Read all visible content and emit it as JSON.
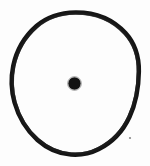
{
  "figure": {
    "title": "Circle with central dot",
    "symbol_name": "sun-symbol",
    "description": "Hand-drawn ink outline of a nearly circular (slightly egg-shaped) ring enclosing a small solid filled dot at the center, on an off-white scanned background.",
    "background_color": "#fdfdfd",
    "ink_color": "#151515",
    "canvas": {
      "width": 150,
      "height": 166
    },
    "outline": {
      "name": "outer-ring",
      "shape": "ellipse",
      "center_x": 75,
      "center_y": 84,
      "radius_x": 63,
      "radius_y": 71,
      "stroke_width": 4.4,
      "stroke_color": "#151515",
      "fill": "none",
      "style": "hand-drawn irregular",
      "bounds": {
        "left": 12,
        "top": 12,
        "right": 139,
        "bottom": 155
      }
    },
    "center_dot": {
      "name": "center-dot",
      "shape": "circle",
      "center_x": 74.5,
      "center_y": 83.5,
      "radius": 6.2,
      "fill_color": "#121212"
    },
    "speck": {
      "name": "ink-speck",
      "center_x": 130,
      "center_y": 138,
      "radius": 1.1,
      "fill_color": "#6a6a6a"
    }
  }
}
